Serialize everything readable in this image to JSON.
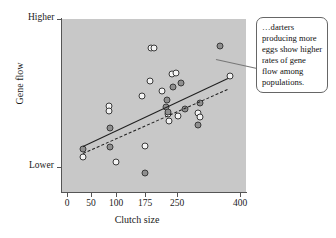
{
  "figure": {
    "background_color": "#ffffff",
    "plot_background_color": "#c8c8c8",
    "axis_color": "#555555"
  },
  "annotation": {
    "text": "…darters producing more eggs show higher rates of gene flow among populations.",
    "leader_line": "callout-leader-line"
  },
  "chart_data": {
    "type": "scatter",
    "title": "",
    "xlabel": "Clutch size",
    "ylabel": "Gene flow",
    "x_tick_labels": [
      "0",
      "50",
      "100",
      "175",
      "250",
      "400"
    ],
    "x_tick_values": [
      0,
      50,
      100,
      175,
      250,
      400
    ],
    "y_tick_labels": [
      "Lower",
      "Higher"
    ],
    "ylim": [
      "Lower",
      "Higher"
    ],
    "grid": false,
    "legend": "none",
    "annotation": "…darters producing more eggs show higher rates of gene flow among populations.",
    "series": [
      {
        "name": "open-circles",
        "marker": "open circle",
        "fill": "#f4f4f4",
        "edge": "#3a3a3a",
        "points": [
          {
            "x": 33,
            "y": 0.205
          },
          {
            "x": 85,
            "y": 0.497
          },
          {
            "x": 85,
            "y": 0.468
          },
          {
            "x": 100,
            "y": 0.175
          },
          {
            "x": 168,
            "y": 0.555
          },
          {
            "x": 175,
            "y": 0.268
          },
          {
            "x": 186,
            "y": 0.64
          },
          {
            "x": 190,
            "y": 0.83
          },
          {
            "x": 197,
            "y": 0.83
          },
          {
            "x": 215,
            "y": 0.585
          },
          {
            "x": 228,
            "y": 0.45
          },
          {
            "x": 232,
            "y": 0.41
          },
          {
            "x": 238,
            "y": 0.68
          },
          {
            "x": 248,
            "y": 0.69
          },
          {
            "x": 252,
            "y": 0.437
          },
          {
            "x": 300,
            "y": 0.455
          },
          {
            "x": 305,
            "y": 0.432
          },
          {
            "x": 375,
            "y": 0.672
          }
        ]
      },
      {
        "name": "filled-circles",
        "marker": "filled circle",
        "fill": "#8f8f8f",
        "edge": "#3a3a3a",
        "points": [
          {
            "x": 33,
            "y": 0.248
          },
          {
            "x": 88,
            "y": 0.37
          },
          {
            "x": 88,
            "y": 0.262
          },
          {
            "x": 175,
            "y": 0.11
          },
          {
            "x": 224,
            "y": 0.492
          },
          {
            "x": 226,
            "y": 0.53
          },
          {
            "x": 228,
            "y": 0.462
          },
          {
            "x": 240,
            "y": 0.608
          },
          {
            "x": 260,
            "y": 0.628
          },
          {
            "x": 268,
            "y": 0.478
          },
          {
            "x": 300,
            "y": 0.39
          },
          {
            "x": 305,
            "y": 0.512
          },
          {
            "x": 352,
            "y": 0.845
          }
        ]
      }
    ],
    "trend_lines": [
      {
        "name": "solid-trend-line",
        "style": "solid",
        "x_start": 33,
        "y_start": 0.268,
        "x_end": 370,
        "y_end": 0.66
      },
      {
        "name": "dashed-trend-line",
        "style": "dashed",
        "x_start": 33,
        "y_start": 0.225,
        "x_end": 370,
        "y_end": 0.595
      }
    ]
  }
}
